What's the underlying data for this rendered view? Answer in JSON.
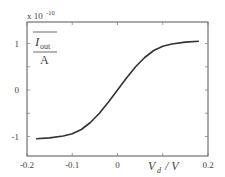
{
  "chart_data": {
    "type": "line",
    "title": "",
    "xlabel": "V_d / V",
    "ylabel": "I_out / A",
    "y_scale_note": "x 10^-10",
    "xlim": [
      -0.2,
      0.2
    ],
    "ylim": [
      -1.5,
      1.5
    ],
    "x_ticks": [
      -0.2,
      -0.1,
      0,
      0.2
    ],
    "x_tick_labels": [
      "-0.2",
      "-0.1",
      "0",
      "0.2"
    ],
    "y_ticks": [
      -1,
      0,
      1
    ],
    "y_tick_labels": [
      "-1",
      "0",
      "1"
    ],
    "grid": false,
    "series": [
      {
        "name": "I_out",
        "x": [
          -0.18,
          -0.15,
          -0.12,
          -0.1,
          -0.08,
          -0.06,
          -0.04,
          -0.02,
          0,
          0.02,
          0.04,
          0.06,
          0.08,
          0.1,
          0.12,
          0.15,
          0.18
        ],
        "y": [
          -1.05,
          -1.03,
          -0.99,
          -0.94,
          -0.85,
          -0.7,
          -0.5,
          -0.26,
          0,
          0.26,
          0.5,
          0.7,
          0.85,
          0.94,
          0.99,
          1.03,
          1.05
        ]
      }
    ]
  },
  "labels": {
    "scale": "x 10",
    "scale_exp": "-10",
    "y_num": "I",
    "y_sub": "out",
    "y_den": "A",
    "x_main": "V",
    "x_sub": "d",
    "x_unit": "/ V"
  }
}
